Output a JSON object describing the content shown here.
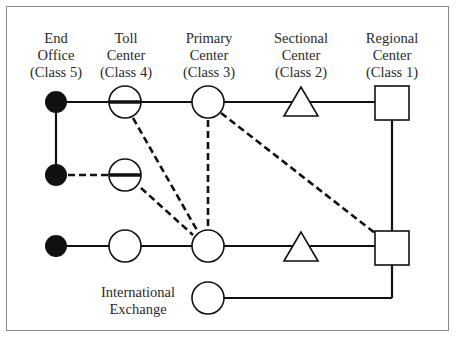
{
  "diagram": {
    "columns": [
      {
        "id": "end-office",
        "line1": "End",
        "line2": "Office",
        "line3": "(Class 5)",
        "x": 56
      },
      {
        "id": "toll-center",
        "line1": "Toll",
        "line2": "Center",
        "line3": "(Class 4)",
        "x": 125
      },
      {
        "id": "primary-center",
        "line1": "Primary",
        "line2": "Center",
        "line3": "(Class 3)",
        "x": 208
      },
      {
        "id": "sectional-center",
        "line1": "Sectional",
        "line2": "Center",
        "line3": "(Class 2)",
        "x": 301
      },
      {
        "id": "regional-center",
        "line1": "Regional",
        "line2": "Center",
        "line3": "(Class 1)",
        "x": 392
      }
    ],
    "international": {
      "line1": "International",
      "line2": "Exchange"
    },
    "legend_shapes": {
      "end_office": "filled-circle",
      "toll_center": "circle",
      "primary_center": "circle",
      "sectional_center": "triangle",
      "regional_center": "square",
      "international_exchange": "circle"
    },
    "line_styles": {
      "solid": "final route",
      "dashed": "high-usage route"
    },
    "colors": {
      "stroke": "#111111",
      "frame": "#8a8a8a",
      "background": "#ffffff"
    }
  }
}
